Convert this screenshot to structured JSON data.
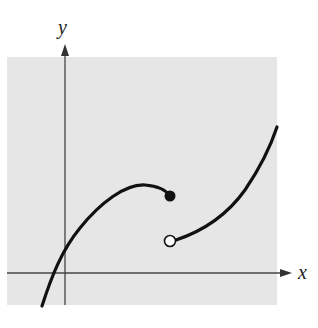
{
  "figure": {
    "type": "piecewise-function-graph",
    "background_color": "#e6e6e6",
    "curve_color": "#111111",
    "axis_color": "#444444"
  },
  "axes": {
    "x_label": "x",
    "y_label": "y"
  },
  "pieces": [
    {
      "name": "left-branch",
      "shape": "concave-down arc rising from lower left, crossing x-axis left of origin, peaking then ending at filled point",
      "endpoint": {
        "type": "closed",
        "marker": "filled-dot"
      }
    },
    {
      "name": "right-branch",
      "shape": "concave-up curve starting at open point below the closed point, rising steeply to the right",
      "endpoint": {
        "type": "open",
        "marker": "open-circle"
      }
    }
  ],
  "features": {
    "discontinuity": "jump discontinuity at the shared x-value of the filled and open points"
  }
}
